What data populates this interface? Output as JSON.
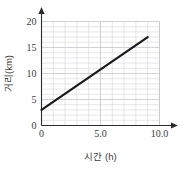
{
  "chart_data": {
    "type": "line",
    "title": "",
    "xlabel": "시간 (h)",
    "ylabel": "거리(km)",
    "xlim": [
      0,
      10
    ],
    "ylim": [
      0,
      20
    ],
    "x_ticks": [
      0,
      5,
      10
    ],
    "x_tick_labels": [
      "0",
      "5.0",
      "10.0"
    ],
    "y_ticks": [
      0,
      5,
      10,
      15,
      20
    ],
    "y_tick_labels": [
      "0",
      "5",
      "10",
      "15",
      "20"
    ],
    "grid": true,
    "grid_minor_x_step": 1,
    "grid_minor_y_step": 1,
    "legend": "none",
    "series": [
      {
        "name": "distance",
        "color": "#1a1a1a",
        "x": [
          0,
          9
        ],
        "values": [
          3,
          17
        ]
      }
    ],
    "annotations": []
  },
  "axes": {
    "x_axis_name": "time-axis",
    "y_axis_name": "distance-axis"
  }
}
